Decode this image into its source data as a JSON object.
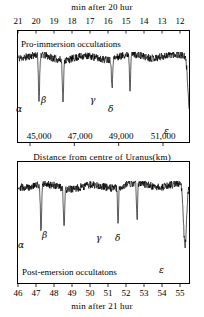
{
  "figure": {
    "top_axis_title": "min after 20 hur",
    "middle_axis_title": "Distance from centre of Uranus(km)",
    "bottom_axis_title": "min after 21 hur",
    "top_panel_caption": "Pro-immersion occultations",
    "bottom_panel_caption": "Post-emersion occultatons"
  },
  "chart_data": {
    "type": "line",
    "panels": [
      {
        "name": "pre-immersion",
        "caption": "Pro-immersion occultations",
        "top_axis": {
          "label": "min after 20 hur",
          "ticks": [
            21,
            20,
            19,
            18,
            17,
            16,
            15,
            14,
            13,
            12
          ],
          "tick_labels": [
            "21",
            "20",
            "19",
            "18",
            "17",
            "16",
            "15",
            "14",
            "13",
            "12"
          ],
          "direction": "decreasing",
          "range": [
            21.5,
            11.5
          ]
        },
        "bottom_axis": {
          "label": "Distance from centre of Uranus(km)",
          "ticks": [
            45000,
            47000,
            49000,
            51000
          ],
          "tick_labels": [
            "45,000",
            "47,000",
            "49,000",
            "51,000"
          ],
          "range": [
            43600,
            51700
          ]
        },
        "ylabel": "Relative stellar intensity",
        "baseline": 1.0,
        "noise_amplitude": 0.06,
        "events": [
          {
            "label": "α",
            "name": "alpha-ring",
            "x_px": 21,
            "depth": 0.72,
            "width_px": 1.4
          },
          {
            "label": "β",
            "name": "beta-ring",
            "x_px": 45,
            "depth": 0.62,
            "width_px": 1.4
          },
          {
            "label": "γ",
            "name": "gamma-ring",
            "x_px": 94,
            "depth": 0.48,
            "width_px": 1.2
          },
          {
            "label": "δ",
            "name": "delta-ring",
            "x_px": 112,
            "depth": 0.56,
            "width_px": 1.2
          },
          {
            "label": "ε",
            "name": "epsilon-ring",
            "x_px": 172,
            "depth": 0.95,
            "width_px": 4.0
          }
        ]
      },
      {
        "name": "post-emersion",
        "caption": "Post-emersion occultatons",
        "bottom_axis": {
          "label": "min after 21 hur",
          "ticks": [
            46,
            47,
            48,
            49,
            50,
            51,
            52,
            53,
            54,
            55
          ],
          "tick_labels": [
            "46",
            "47",
            "48",
            "49",
            "50",
            "51",
            "52",
            "53",
            "54",
            "55"
          ],
          "direction": "increasing",
          "range": [
            45.5,
            55.4
          ]
        },
        "ylabel": "Relative stellar intensity",
        "baseline": 1.0,
        "noise_amplitude": 0.06,
        "events": [
          {
            "label": "α",
            "name": "alpha-ring",
            "x_px": 23,
            "depth": 0.74,
            "width_px": 1.4
          },
          {
            "label": "β",
            "name": "beta-ring",
            "x_px": 46,
            "depth": 0.62,
            "width_px": 1.4
          },
          {
            "label": "γ",
            "name": "gamma-ring",
            "x_px": 100,
            "depth": 0.55,
            "width_px": 1.2
          },
          {
            "label": "δ",
            "name": "delta-ring",
            "x_px": 119,
            "depth": 0.58,
            "width_px": 1.2
          },
          {
            "label": "ε",
            "name": "epsilon-ring",
            "x_px": 167,
            "depth": 0.97,
            "width_px": 3.4
          }
        ]
      }
    ],
    "grid": false,
    "legend": "none",
    "colors": {
      "trace": "#000000",
      "frame": "#000000",
      "background": "#ffffff"
    }
  }
}
